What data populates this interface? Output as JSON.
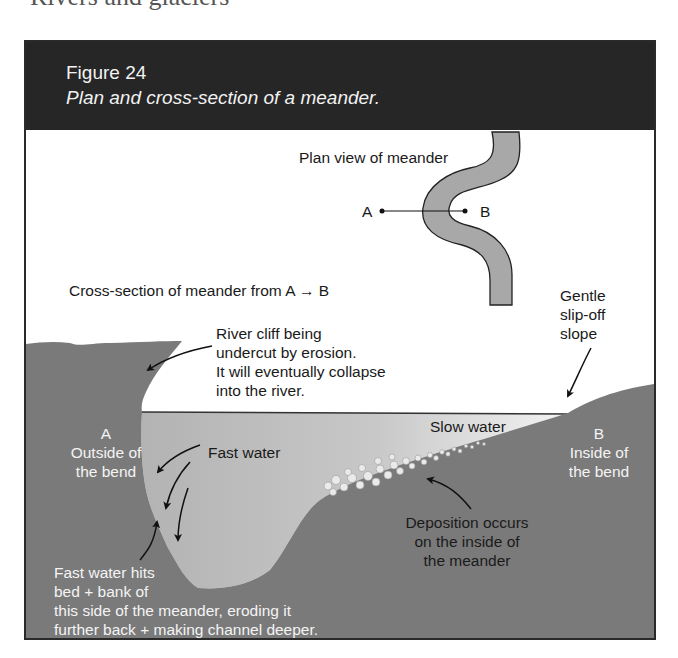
{
  "page": {
    "cut_heading": "Rivers and glaciers"
  },
  "figure": {
    "number": "Figure 24",
    "caption": "Plan and cross-section of a meander."
  },
  "plan_view": {
    "title": "Plan view of meander",
    "point_a": "A",
    "point_b": "B"
  },
  "cross_section": {
    "title": "Cross-section of meander from A → B",
    "river_cliff_1": "River cliff being",
    "river_cliff_2": "undercut by erosion.",
    "river_cliff_3": "It will eventually collapse",
    "river_cliff_4": "into the river.",
    "slip_off_1": "Gentle",
    "slip_off_2": "slip-off",
    "slip_off_3": "slope",
    "a_label": "A",
    "a_desc_1": "Outside of",
    "a_desc_2": "the bend",
    "b_label": "B",
    "b_desc_1": "Inside of",
    "b_desc_2": "the bend",
    "fast_water": "Fast water",
    "slow_water": "Slow water",
    "deposition_1": "Deposition occurs",
    "deposition_2": "on the inside of",
    "deposition_3": "the meander",
    "erosion_1": "Fast water hits",
    "erosion_2": "bed + bank of",
    "erosion_3": "this side of the meander, eroding it",
    "erosion_4": "further back + making channel deeper."
  },
  "colors": {
    "header_bg": "#262626",
    "land": "#7a7a7a",
    "water_deep": "#b3b3b3",
    "water_shallow": "#f0f0f0",
    "river_plan": "#a8a8a8"
  }
}
